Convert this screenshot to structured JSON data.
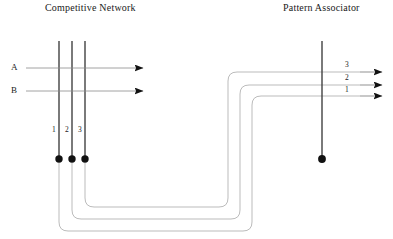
{
  "figure": {
    "kind": "neural-network-schematic",
    "titles": {
      "left": "Competitive Network",
      "right": "Pattern Associator"
    },
    "inputs": [
      {
        "label": "A"
      },
      {
        "label": "B"
      }
    ],
    "competitive_units": [
      {
        "label": "1"
      },
      {
        "label": "2"
      },
      {
        "label": "3"
      }
    ],
    "pattern_outputs": [
      {
        "label": "3"
      },
      {
        "label": "2"
      },
      {
        "label": "1"
      }
    ],
    "colors": {
      "dendrite": "#3a3a3a",
      "axon": "#8c8c8c",
      "wire": "#a9a9a9",
      "soma": "#111111",
      "text": "#1a1a1a"
    }
  }
}
